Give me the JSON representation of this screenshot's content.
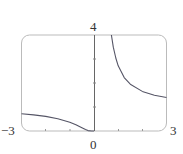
{
  "chart_data": {
    "type": "line",
    "title": "",
    "xlabel": "",
    "ylabel": "",
    "xlim": [
      -3,
      3
    ],
    "ylim": [
      0,
      4
    ],
    "grid": false,
    "legend": null,
    "function": "y = e^(1/x)",
    "x_tick_labels": [
      "−3",
      "0",
      "3"
    ],
    "y_tick_labels": [
      "4"
    ],
    "x_ticks": [
      -3,
      -2,
      -1,
      0,
      1,
      2,
      3
    ],
    "y_ticks": [
      0,
      1,
      2,
      3,
      4
    ],
    "series": [
      {
        "name": "left branch (x<0)",
        "x": [
          -3,
          -2.5,
          -2,
          -1.5,
          -1,
          -0.75,
          -0.5,
          -0.35,
          -0.25,
          -0.1,
          0
        ],
        "y": [
          0.717,
          0.67,
          0.607,
          0.513,
          0.368,
          0.264,
          0.135,
          0.057,
          0.018,
          0.0,
          0.0
        ]
      },
      {
        "name": "right branch (x>0)",
        "x": [
          0.72,
          0.8,
          0.9,
          1,
          1.25,
          1.5,
          2,
          2.5,
          3
        ],
        "y": [
          4.0,
          3.49,
          3.04,
          2.718,
          2.226,
          1.948,
          1.649,
          1.492,
          1.396
        ]
      }
    ],
    "colors": {
      "curve": "#555566",
      "frame": "#bbbbbb",
      "axis": "#666666"
    }
  },
  "labels": {
    "x_min": "−3",
    "x_zero": "0",
    "x_max": "3",
    "y_max": "4"
  }
}
